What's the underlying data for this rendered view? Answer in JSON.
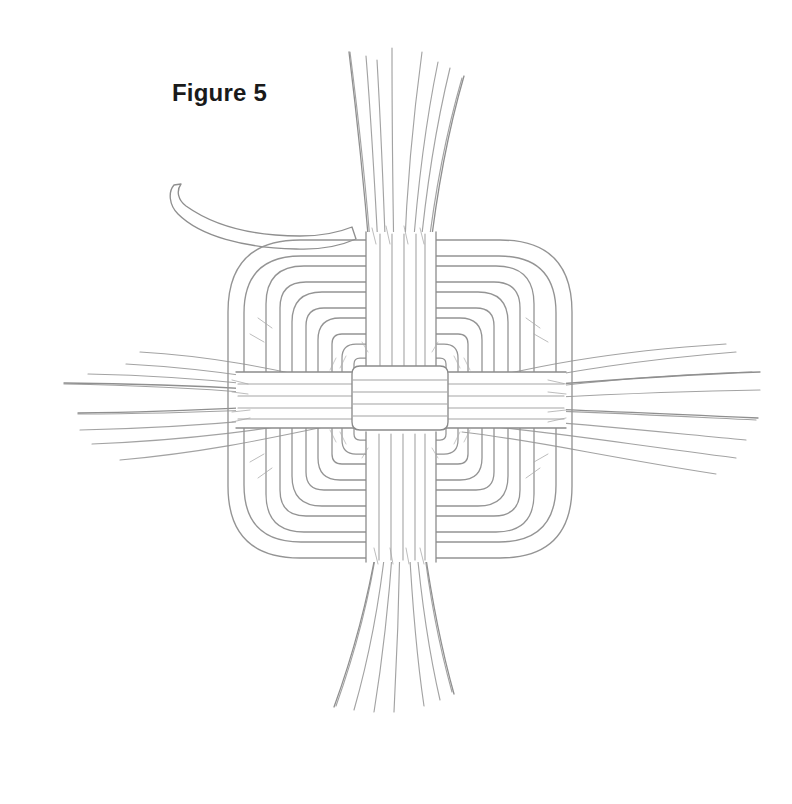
{
  "page": {
    "background_color": "#ffffff",
    "width": 792,
    "height": 804,
    "medium": "pencil-line-drawing"
  },
  "caption": {
    "text": "Figure 5",
    "color": "#1a1a1a",
    "x": 172,
    "y": 79,
    "font_size_px": 24,
    "font_weight": "bold"
  },
  "artwork": {
    "title": "Figure 5",
    "subject": "woven square mat knot diagram",
    "description": "Hand-drawn pencil illustration of a flat square knot woven from flat cord, with concentric rounded-square loops surrounding a plaited center, and four bundles of loose strands exiting top, bottom, left and right.",
    "stroke_color": "#9a9a9a",
    "stroke_color_dark": "#7d7d7d",
    "stroke_color_light": "#bcbcbc",
    "fill_color": "#ffffff",
    "center": {
      "x": 400,
      "y": 398
    },
    "knot_bounds": {
      "left": 228,
      "top": 236,
      "right": 572,
      "bottom": 560
    },
    "concentric_loops": 6,
    "corner_radius_outer": 74,
    "bundles": [
      {
        "name": "top-strand-bundle",
        "direction": "up",
        "strand_count": 8,
        "origin_x": 400,
        "origin_y": 236,
        "tip_y": 44
      },
      {
        "name": "bottom-strand-bundle",
        "direction": "down",
        "strand_count": 7,
        "origin_x": 400,
        "origin_y": 560,
        "tip_y": 712
      },
      {
        "name": "left-strand-bundle",
        "direction": "left",
        "strand_count": 8,
        "origin_x": 250,
        "origin_y": 398,
        "tip_x": 38
      },
      {
        "name": "right-strand-bundle",
        "direction": "right",
        "strand_count": 8,
        "origin_x": 552,
        "origin_y": 398,
        "tip_x": 762
      }
    ],
    "loose_end": {
      "name": "upper-left-loose-cord-end",
      "tip_x": 180,
      "tip_y": 186,
      "enters_knot_x": 340,
      "enters_knot_y": 232
    },
    "center_weave": {
      "horizontal_bands": 4,
      "vertical_bands": 4,
      "box": {
        "left": 352,
        "top": 352,
        "right": 448,
        "bottom": 444
      }
    }
  }
}
